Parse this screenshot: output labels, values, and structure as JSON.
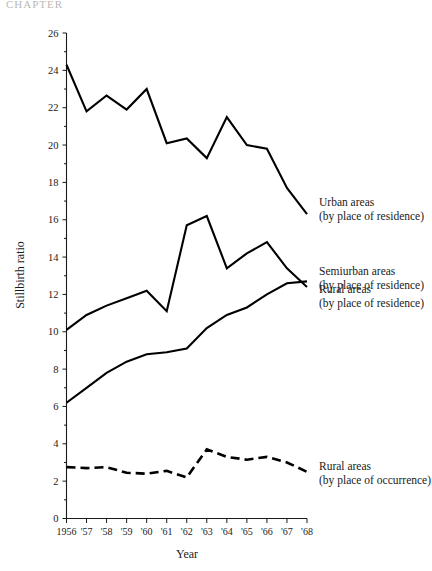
{
  "figure": {
    "cropped_header_text": "CHAPTER",
    "xlabel": "Year",
    "ylabel": "Stillbirth ratio"
  },
  "chart_data": {
    "type": "line",
    "title": "",
    "xlabel": "Year",
    "ylabel": "Stillbirth ratio",
    "xlim": [
      1956,
      1968
    ],
    "ylim": [
      0,
      26
    ],
    "ytick_step": 2,
    "grid": false,
    "legend_position": "inline-annotations",
    "categories": [
      "1956",
      "'57",
      "'58",
      "'59",
      "'60",
      "'61",
      "'62",
      "'63",
      "'64",
      "'65",
      "'66",
      "'67",
      "'68"
    ],
    "yticks": [
      "0",
      "2",
      "4",
      "6",
      "8",
      "10",
      "12",
      "14",
      "16",
      "18",
      "20",
      "22",
      "24",
      "26"
    ],
    "series": [
      {
        "name": "Urban areas (by place of residence)",
        "label_line1": "Urban areas",
        "label_line2": "(by place of residence)",
        "style": "solid",
        "color": "#000000",
        "values": [
          24.3,
          21.8,
          22.65,
          21.9,
          23.0,
          20.1,
          20.35,
          19.3,
          21.5,
          20.0,
          19.8,
          17.7,
          16.3
        ]
      },
      {
        "name": "Semiurban areas (by place of residence)",
        "label_line1": "Semiurban areas",
        "label_line2": "(by place of residence)",
        "style": "solid",
        "color": "#000000",
        "values": [
          10.1,
          10.9,
          11.4,
          11.8,
          12.2,
          11.1,
          15.7,
          16.2,
          13.4,
          14.2,
          14.8,
          13.4,
          12.4
        ]
      },
      {
        "name": "Rural areas (by place of residence)",
        "label_line1": "Rural areas",
        "label_line2": "(by place of residence)",
        "style": "solid",
        "color": "#000000",
        "values": [
          6.2,
          7.0,
          7.8,
          8.4,
          8.8,
          8.9,
          9.1,
          10.2,
          10.9,
          11.3,
          12.0,
          12.6,
          12.7
        ]
      },
      {
        "name": "Rural areas (by place of occurrence)",
        "label_line1": "Rural areas",
        "label_line2": "(by place of occurrence)",
        "style": "dashed",
        "color": "#000000",
        "values": [
          2.75,
          2.7,
          2.75,
          2.45,
          2.4,
          2.55,
          2.2,
          3.7,
          3.3,
          3.15,
          3.3,
          3.0,
          2.5
        ]
      }
    ],
    "annotations": [
      {
        "text_line1": "Urban areas",
        "text_line2": "(by place of residence)",
        "anchor_x": 1968,
        "anchor_y": 16.3
      },
      {
        "text_line1": "Semiurban areas",
        "text_line2": "(by place of residence)",
        "anchor_x": 1968,
        "anchor_y": 12.4
      },
      {
        "text_line1": "Rural areas",
        "text_line2": "(by place of residence)",
        "anchor_x": 1968,
        "anchor_y": 12.7
      },
      {
        "text_line1": "Rural areas",
        "text_line2": "(by place of occurrence)",
        "anchor_x": 1968,
        "anchor_y": 2.5
      }
    ]
  }
}
